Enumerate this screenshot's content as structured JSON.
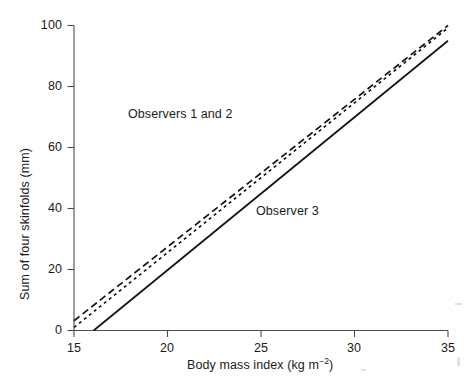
{
  "chart_data": {
    "type": "line",
    "title": "",
    "xlabel": "Body mass index (kg m-2)",
    "ylabel": "Sum of four skinfolds (mm)",
    "xlim": [
      15,
      35
    ],
    "ylim": [
      0,
      100
    ],
    "xticks": [
      15,
      20,
      25,
      30,
      35
    ],
    "yticks": [
      0,
      20,
      40,
      60,
      80,
      100
    ],
    "grid": false,
    "legend_position": "inline-annotations",
    "annotations": [
      {
        "text": "Observers 1 and 2",
        "x": 17.9,
        "y": 71
      },
      {
        "text": "Observer 3",
        "x": 24.7,
        "y": 42
      }
    ],
    "series": [
      {
        "name": "Observer 1",
        "style": "dashed-long",
        "x": [
          15,
          35
        ],
        "y": [
          3.2,
          100.0
        ]
      },
      {
        "name": "Observer 2",
        "style": "dashed-short",
        "x": [
          15,
          35
        ],
        "y": [
          1.0,
          99.2
        ]
      },
      {
        "name": "Observer 3",
        "style": "solid",
        "x": [
          16.05,
          35
        ],
        "y": [
          0.0,
          95.0
        ]
      }
    ]
  },
  "axis": {
    "x_title_prefix": "Body mass index (kg m",
    "x_title_exponent": "−2",
    "x_title_suffix": ")",
    "y_title": "Sum of four skinfolds (mm)",
    "xticks": {
      "t0": "15",
      "t1": "20",
      "t2": "25",
      "t3": "30",
      "t4": "35"
    },
    "yticks": {
      "t0": "0",
      "t1": "20",
      "t2": "40",
      "t3": "60",
      "t4": "80",
      "t5": "100"
    }
  },
  "annotations": {
    "observers_1_2": "Observers 1 and 2",
    "observer_3": "Observer 3"
  },
  "colors": {
    "line": "#111111",
    "axis": "#4d4d4d",
    "text": "#1a1a1a",
    "background": "#ffffff"
  }
}
